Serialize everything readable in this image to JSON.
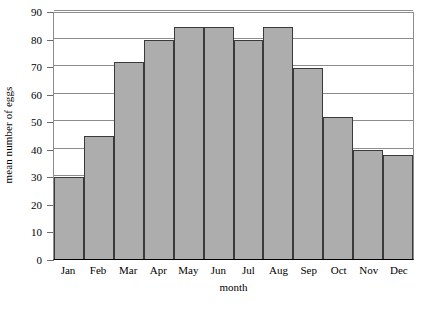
{
  "chart_data": {
    "type": "bar",
    "title": "",
    "xlabel": "month",
    "ylabel": "mean number of eggs",
    "categories": [
      "Jan",
      "Feb",
      "Mar",
      "Apr",
      "May",
      "Jun",
      "Jul",
      "Aug",
      "Sep",
      "Oct",
      "Nov",
      "Dec"
    ],
    "values": [
      30,
      45,
      72,
      80,
      85,
      85,
      80,
      85,
      70,
      52,
      40,
      38
    ],
    "ylim": [
      0,
      90
    ],
    "ytick_labels": [
      "0",
      "10",
      "20",
      "30",
      "40",
      "50",
      "60",
      "70",
      "80",
      "90"
    ],
    "ytick_values": [
      0,
      10,
      20,
      30,
      40,
      50,
      60,
      70,
      80,
      90
    ],
    "grid": true,
    "legend": false,
    "bar_color": "#adadad",
    "bar_edge_color": "#3a3a3a",
    "grid_color": "#8c8c8c",
    "axis_color": "#000000",
    "background": "#ffffff"
  }
}
